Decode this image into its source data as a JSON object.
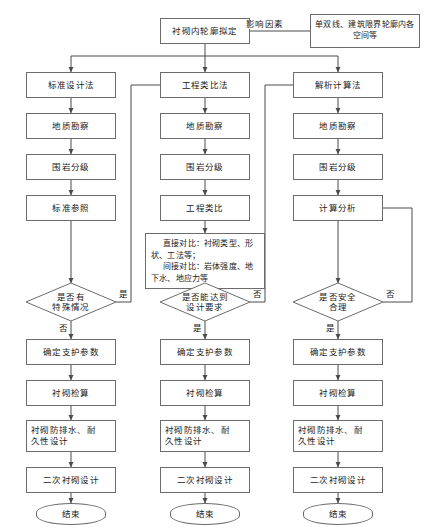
{
  "diagram": {
    "title_node": "衬砌内轮廓拟定",
    "influence_label": "影响因素",
    "influence_source": "单双线、建筑限界轮廓内各空间等",
    "yes_label": "是",
    "no_label": "否",
    "end_label": "结束",
    "columns": [
      {
        "id": "standard-design-method",
        "method": "标准设计法",
        "steps": [
          "地质勘察",
          "围岩分级",
          "标准参照"
        ],
        "decision": "是否有\n特殊情况",
        "decision_line1": "是否有",
        "decision_line2": "特殊情况",
        "branch_side": "是",
        "branch_down": "否",
        "post": [
          "确定支护参数",
          "衬砌检算",
          "衬砌防排水、耐\n久性设计",
          "二次衬砌设计"
        ],
        "post_1": "确定支护参数",
        "post_2": "衬砌检算",
        "post_3a": "衬砌防排水、耐",
        "post_3b": "久性设计",
        "post_4": "二次衬砌设计",
        "end": "结束"
      },
      {
        "id": "engineering-analogy-method",
        "method": "工程类比法",
        "steps": [
          "地质勘察",
          "围岩分级",
          "工程类比"
        ],
        "detail_line1": "直接对比：衬砌类型、形",
        "detail_line2": "状、工法等；",
        "detail_line3": "间接对比：岩体强度、地",
        "detail_line4": "下水、地应力等",
        "decision_line1": "是否能达到",
        "decision_line2": "设计要求",
        "branch_side": "否",
        "branch_down": "是",
        "post_1": "确定支护参数",
        "post_2": "衬砌检算",
        "post_3a": "衬砌防排水、耐",
        "post_3b": "久性设计",
        "post_4": "二次衬砌设计",
        "end": "结束"
      },
      {
        "id": "analytical-calculation-method",
        "method": "解析计算法",
        "steps": [
          "地质勘察",
          "围岩分级",
          "计算分析"
        ],
        "decision_line1": "是否安全",
        "decision_line2": "合理",
        "branch_side": "否",
        "branch_down": "是",
        "post_1": "确定支护参数",
        "post_2": "衬砌检算",
        "post_3a": "衬砌防排水、耐",
        "post_3b": "久性设计",
        "post_4": "二次衬砌设计",
        "end": "结束"
      }
    ],
    "colors": {
      "stroke": "#6b6b6b",
      "line": "#4a4a4a",
      "text": "#1a1a1a",
      "background": "#ffffff"
    }
  }
}
